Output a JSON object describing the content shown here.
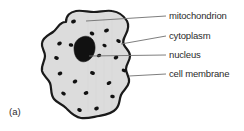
{
  "figure": {
    "panel_letter": "(a)",
    "caption_subject": "animal cell",
    "labels": [
      {
        "id": "mitochondrion",
        "text": "mitochondrion"
      },
      {
        "id": "cytoplasm",
        "text": "cytoplasm"
      },
      {
        "id": "nucleus",
        "text": "nucleus"
      },
      {
        "id": "cell_membrane",
        "text": "cell membrane"
      }
    ],
    "colors": {
      "cytoplasm_fill": "#dcdcdc",
      "membrane_stroke": "#1a1a1a",
      "nucleus_fill": "#111111",
      "mitochondrion_fill": "#111111",
      "leader_line": "#6f6f6f",
      "text": "#2b2b2b",
      "background": "#ffffff"
    },
    "structures": {
      "cell_membrane": {
        "name": "cell-membrane-outline",
        "stroke_width": 2.2
      },
      "cytoplasm": {
        "name": "cytoplasm-region"
      },
      "nucleus": {
        "name": "nucleus-blob"
      },
      "mitochondria": {
        "name": "mitochondria-dots",
        "count": 20,
        "positions": [
          {
            "cx": 73.5,
            "cy": 21.5,
            "rx": 2.5,
            "ry": 1.9,
            "rot": -20
          },
          {
            "cx": 92.0,
            "cy": 33.5,
            "rx": 2.4,
            "ry": 1.8,
            "rot": 25
          },
          {
            "cx": 106.5,
            "cy": 30.5,
            "rx": 2.5,
            "ry": 1.9,
            "rot": -15
          },
          {
            "cx": 118.5,
            "cy": 41.0,
            "rx": 2.4,
            "ry": 1.8,
            "rot": 30
          },
          {
            "cx": 116.0,
            "cy": 57.5,
            "rx": 2.4,
            "ry": 1.8,
            "rot": -25
          },
          {
            "cx": 124.0,
            "cy": 70.5,
            "rx": 2.4,
            "ry": 1.7,
            "rot": 20
          },
          {
            "cx": 109.0,
            "cy": 83.0,
            "rx": 2.5,
            "ry": 1.8,
            "rot": -30
          },
          {
            "cx": 112.5,
            "cy": 96.5,
            "rx": 2.3,
            "ry": 1.7,
            "rot": 15
          },
          {
            "cx": 96.5,
            "cy": 108.5,
            "rx": 2.4,
            "ry": 1.8,
            "rot": -20
          },
          {
            "cx": 79.5,
            "cy": 110.0,
            "rx": 2.4,
            "ry": 1.8,
            "rot": 25
          },
          {
            "cx": 86.0,
            "cy": 93.0,
            "rx": 2.4,
            "ry": 1.8,
            "rot": -15
          },
          {
            "cx": 92.5,
            "cy": 73.0,
            "rx": 2.5,
            "ry": 1.9,
            "rot": 20
          },
          {
            "cx": 75.0,
            "cy": 81.5,
            "rx": 2.4,
            "ry": 1.8,
            "rot": -25
          },
          {
            "cx": 63.5,
            "cy": 93.5,
            "rx": 2.4,
            "ry": 1.8,
            "rot": 30
          },
          {
            "cx": 60.0,
            "cy": 73.5,
            "rx": 2.4,
            "ry": 1.8,
            "rot": -20
          },
          {
            "cx": 56.5,
            "cy": 58.0,
            "rx": 2.4,
            "ry": 1.8,
            "rot": 20
          },
          {
            "cx": 59.5,
            "cy": 43.5,
            "rx": 2.4,
            "ry": 1.8,
            "rot": -25
          },
          {
            "cx": 71.0,
            "cy": 45.0,
            "rx": 2.3,
            "ry": 1.7,
            "rot": 15
          },
          {
            "cx": 99.0,
            "cy": 55.5,
            "rx": 2.3,
            "ry": 1.7,
            "rot": -20
          },
          {
            "cx": 104.5,
            "cy": 45.5,
            "rx": 2.2,
            "ry": 1.6,
            "rot": 25
          }
        ]
      }
    },
    "leader_lines": [
      {
        "id": "mitochondrion",
        "x1": 86,
        "y1": 21,
        "x2": 166,
        "y2": 16
      },
      {
        "id": "cytoplasm",
        "x1": 121,
        "y1": 44,
        "x2": 166,
        "y2": 36
      },
      {
        "id": "nucleus",
        "x1": 89,
        "y1": 56,
        "x2": 166,
        "y2": 55
      },
      {
        "id": "cell_membrane",
        "x1": 129,
        "y1": 76,
        "x2": 166,
        "y2": 74
      }
    ]
  }
}
